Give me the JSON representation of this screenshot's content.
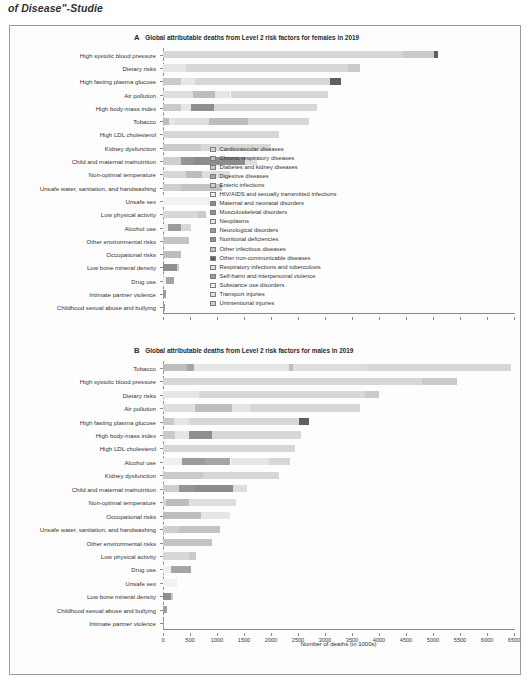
{
  "caption_fragment": "of Disease\"-Studie",
  "axis_title": "Number of deaths (in 1000s)",
  "xaxis": {
    "ticks": [
      0,
      500,
      1000,
      1500,
      2000,
      2500,
      3000,
      3500,
      4000,
      4500,
      5000,
      5500,
      6000,
      6500
    ],
    "tick_labels": [
      "0",
      "500",
      "1000",
      "1500",
      "2000",
      "2500",
      "3000",
      "3500",
      "4000",
      "4500",
      "5000",
      "5500",
      "6000",
      "6500"
    ],
    "min": 0,
    "max": 6500
  },
  "legend": {
    "position": "inside-right",
    "items": [
      {
        "label": "Cardiovascular diseases",
        "color": "#d7d7d7"
      },
      {
        "label": "Chronic respiratory diseases",
        "color": "#bdbdbd"
      },
      {
        "label": "Diabetes and kidney diseases",
        "color": "#cacaca"
      },
      {
        "label": "Digestive diseases",
        "color": "#a5a5a5"
      },
      {
        "label": "Enteric infections",
        "color": "#cfcfcf"
      },
      {
        "label": "HIV/AIDS and sexually transmitted infections",
        "color": "#f2f2f2"
      },
      {
        "label": "Maternal and neonatal disorders",
        "color": "#8c8c8c"
      },
      {
        "label": "Musculoskeletal disorders",
        "color": "#8f8f8f"
      },
      {
        "label": "Neoplasms",
        "color": "#e6e6e6"
      },
      {
        "label": "Neurological disorders",
        "color": "#9b9b9b"
      },
      {
        "label": "Nutritional deficiencies",
        "color": "#949494"
      },
      {
        "label": "Other infectious diseases",
        "color": "#c4c4c4"
      },
      {
        "label": "Other non-communicable diseases",
        "color": "#5f5f5f"
      },
      {
        "label": "Respiratory infections and tuberculosis",
        "color": "#dedede"
      },
      {
        "label": "Self-harm and interpersonal violence",
        "color": "#9e9e9e"
      },
      {
        "label": "Substance use disorders",
        "color": "#efefef"
      },
      {
        "label": "Transport injuries",
        "color": "#e2e2e2"
      },
      {
        "label": "Unintentional injuries",
        "color": "#cdcdcd"
      }
    ]
  },
  "chart_data": [
    {
      "type": "bar",
      "orientation": "horizontal",
      "panel": "A",
      "panel_letter": "A",
      "title": "Global attributable deaths from Level 2 risk factors for females in 2019",
      "xlabel": "Number of deaths (in 1000s)",
      "ylabel": "",
      "xlim": [
        0,
        6500
      ],
      "grid": false,
      "stacked": true,
      "categories": [
        "High systolic blood pressure",
        "Dietary risks",
        "High fasting plasma glucose",
        "Air pollution",
        "High body-mass index",
        "Tobacco",
        "High LDL cholesterol",
        "Kidney dysfunction",
        "Child and maternal malnutrition",
        "Non-optimal temperature",
        "Unsafe water, sanitation, and handwashing",
        "Unsafe sex",
        "Low physical activity",
        "Alcohol use",
        "Other environmental risks",
        "Occupational risks",
        "Low bone mineral density",
        "Drug use",
        "Intimate partner violence",
        "Childhood sexual abuse and bullying"
      ],
      "totals": [
        5100,
        3650,
        3300,
        3050,
        2850,
        2700,
        2150,
        2000,
        1750,
        1250,
        1100,
        850,
        800,
        520,
        480,
        330,
        290,
        200,
        55,
        45
      ],
      "stacks": [
        [
          {
            "s": "Cardiovascular diseases",
            "v": 4450
          },
          {
            "s": "Diabetes and kidney diseases",
            "v": 560
          },
          {
            "s": "Other non-communicable diseases",
            "v": 90
          }
        ],
        [
          {
            "s": "Neoplasms",
            "v": 430
          },
          {
            "s": "Cardiovascular diseases",
            "v": 3000
          },
          {
            "s": "Diabetes and kidney diseases",
            "v": 220
          }
        ],
        [
          {
            "s": "Diabetes and kidney diseases",
            "v": 330
          },
          {
            "s": "Neoplasms",
            "v": 260
          },
          {
            "s": "Cardiovascular diseases",
            "v": 2500
          },
          {
            "s": "Other non-communicable diseases",
            "v": 210
          }
        ],
        [
          {
            "s": "Respiratory infections and tuberculosis",
            "v": 560
          },
          {
            "s": "Chronic respiratory diseases",
            "v": 410
          },
          {
            "s": "Neoplasms",
            "v": 280
          },
          {
            "s": "Cardiovascular diseases",
            "v": 1800
          }
        ],
        [
          {
            "s": "Diabetes and kidney diseases",
            "v": 330
          },
          {
            "s": "Neoplasms",
            "v": 190
          },
          {
            "s": "Musculoskeletal disorders",
            "v": 420
          },
          {
            "s": "Cardiovascular diseases",
            "v": 1910
          }
        ],
        [
          {
            "s": "Chronic respiratory diseases",
            "v": 120
          },
          {
            "s": "Neoplasms",
            "v": 110
          },
          {
            "s": "Respiratory infections and tuberculosis",
            "v": 620
          },
          {
            "s": "Chronic respiratory diseases",
            "v": 730
          },
          {
            "s": "Cardiovascular diseases",
            "v": 1120
          }
        ],
        [
          {
            "s": "Cardiovascular diseases",
            "v": 2150
          }
        ],
        [
          {
            "s": "Diabetes and kidney diseases",
            "v": 700
          },
          {
            "s": "Cardiovascular diseases",
            "v": 1300
          }
        ],
        [
          {
            "s": "Enteric infections",
            "v": 330
          },
          {
            "s": "Nutritional deficiencies",
            "v": 250
          },
          {
            "s": "Maternal and neonatal disorders",
            "v": 930
          },
          {
            "s": "Respiratory infections and tuberculosis",
            "v": 240
          }
        ],
        [
          {
            "s": "Cardiovascular diseases",
            "v": 420
          },
          {
            "s": "Chronic respiratory diseases",
            "v": 300
          },
          {
            "s": "Respiratory infections and tuberculosis",
            "v": 530
          }
        ],
        [
          {
            "s": "Enteric infections",
            "v": 330
          },
          {
            "s": "Other infectious diseases",
            "v": 770
          }
        ],
        [
          {
            "s": "HIV/AIDS and sexually transmitted infections",
            "v": 830
          },
          {
            "s": "Neoplasms",
            "v": 20
          }
        ],
        [
          {
            "s": "Cardiovascular diseases",
            "v": 640
          },
          {
            "s": "Diabetes and kidney diseases",
            "v": 160
          }
        ],
        [
          {
            "s": "Substance use disorders",
            "v": 90
          },
          {
            "s": "Neurological disorders",
            "v": 250
          },
          {
            "s": "Cardiovascular diseases",
            "v": 180
          }
        ],
        [
          {
            "s": "Other infectious diseases",
            "v": 480
          }
        ],
        [
          {
            "s": "Chronic respiratory diseases",
            "v": 330
          }
        ],
        [
          {
            "s": "Musculoskeletal disorders",
            "v": 250
          },
          {
            "s": "Unintentional injuries",
            "v": 40
          }
        ],
        [
          {
            "s": "Substance use disorders",
            "v": 60
          },
          {
            "s": "Digestive diseases",
            "v": 140
          }
        ],
        [
          {
            "s": "Self-harm and interpersonal violence",
            "v": 55
          }
        ],
        [
          {
            "s": "Self-harm and interpersonal violence",
            "v": 45
          }
        ]
      ]
    },
    {
      "type": "bar",
      "orientation": "horizontal",
      "panel": "B",
      "panel_letter": "B",
      "title": "Global attributable deaths from Level 2 risk factors for males in 2019",
      "xlabel": "Number of deaths (in 1000s)",
      "ylabel": "",
      "xlim": [
        0,
        6500
      ],
      "grid": false,
      "stacked": true,
      "categories": [
        "Tobacco",
        "High systolic blood pressure",
        "Dietary risks",
        "Air pollution",
        "High fasting plasma glucose",
        "High body-mass index",
        "High LDL cholesterol",
        "Alcohol use",
        "Kidney dysfunction",
        "Child and maternal malnutrition",
        "Non-optimal temperature",
        "Occupational risks",
        "Unsafe water, sanitation, and handwashing",
        "Other environmental risks",
        "Low physical activity",
        "Drug use",
        "Unsafe sex",
        "Low bone mineral density",
        "Childhood sexual abuse and bullying",
        "Intimate partner violence"
      ],
      "totals": [
        6450,
        5450,
        4000,
        3650,
        2700,
        2550,
        2450,
        2350,
        2150,
        1550,
        1350,
        1250,
        1050,
        900,
        620,
        520,
        260,
        190,
        70,
        25
      ],
      "stacks": [
        [
          {
            "s": "Chronic respiratory diseases",
            "v": 440
          },
          {
            "s": "Digestive diseases",
            "v": 140
          },
          {
            "s": "Neoplasms",
            "v": 1760
          },
          {
            "s": "Chronic respiratory diseases",
            "v": 70
          },
          {
            "s": "Respiratory infections and tuberculosis",
            "v": 1360
          },
          {
            "s": "Cardiovascular diseases",
            "v": 2680
          }
        ],
        [
          {
            "s": "Cardiovascular diseases",
            "v": 4800
          },
          {
            "s": "Diabetes and kidney diseases",
            "v": 650
          }
        ],
        [
          {
            "s": "Neoplasms",
            "v": 660
          },
          {
            "s": "Cardiovascular diseases",
            "v": 3080
          },
          {
            "s": "Diabetes and kidney diseases",
            "v": 260
          }
        ],
        [
          {
            "s": "Respiratory infections and tuberculosis",
            "v": 590
          },
          {
            "s": "Chronic respiratory diseases",
            "v": 690
          },
          {
            "s": "Neoplasms",
            "v": 330
          },
          {
            "s": "Cardiovascular diseases",
            "v": 2040
          }
        ],
        [
          {
            "s": "Diabetes and kidney diseases",
            "v": 200
          },
          {
            "s": "Neoplasms",
            "v": 280
          },
          {
            "s": "Cardiovascular diseases",
            "v": 2030
          },
          {
            "s": "Other non-communicable diseases",
            "v": 190
          }
        ],
        [
          {
            "s": "Diabetes and kidney diseases",
            "v": 220
          },
          {
            "s": "Neoplasms",
            "v": 260
          },
          {
            "s": "Musculoskeletal disorders",
            "v": 430
          },
          {
            "s": "Cardiovascular diseases",
            "v": 1640
          }
        ],
        [
          {
            "s": "Cardiovascular diseases",
            "v": 2450
          }
        ],
        [
          {
            "s": "Substance use disorders",
            "v": 350
          },
          {
            "s": "Neurological disorders",
            "v": 420
          },
          {
            "s": "Digestive diseases",
            "v": 480
          },
          {
            "s": "Neoplasms",
            "v": 720
          },
          {
            "s": "Cardiovascular diseases",
            "v": 380
          }
        ],
        [
          {
            "s": "Diabetes and kidney diseases",
            "v": 740
          },
          {
            "s": "Cardiovascular diseases",
            "v": 1410
          }
        ],
        [
          {
            "s": "Enteric infections",
            "v": 290
          },
          {
            "s": "Nutritional deficiencies",
            "v": 300
          },
          {
            "s": "Maternal and neonatal disorders",
            "v": 700
          },
          {
            "s": "Respiratory infections and tuberculosis",
            "v": 260
          }
        ],
        [
          {
            "s": "Cardiovascular diseases",
            "v": 60
          },
          {
            "s": "Chronic respiratory diseases",
            "v": 420
          },
          {
            "s": "Respiratory infections and tuberculosis",
            "v": 870
          }
        ],
        [
          {
            "s": "Chronic respiratory diseases",
            "v": 700
          },
          {
            "s": "Neoplasms",
            "v": 550
          }
        ],
        [
          {
            "s": "Enteric infections",
            "v": 300
          },
          {
            "s": "Other infectious diseases",
            "v": 750
          }
        ],
        [
          {
            "s": "Other infectious diseases",
            "v": 900
          }
        ],
        [
          {
            "s": "Cardiovascular diseases",
            "v": 490
          },
          {
            "s": "Diabetes and kidney diseases",
            "v": 130
          }
        ],
        [
          {
            "s": "Substance use disorders",
            "v": 150
          },
          {
            "s": "Digestive diseases",
            "v": 370
          }
        ],
        [
          {
            "s": "HIV/AIDS and sexually transmitted infections",
            "v": 260
          }
        ],
        [
          {
            "s": "Musculoskeletal disorders",
            "v": 150
          },
          {
            "s": "Unintentional injuries",
            "v": 40
          }
        ],
        [
          {
            "s": "Self-harm and interpersonal violence",
            "v": 70
          }
        ],
        [
          {
            "s": "Self-harm and interpersonal violence",
            "v": 25
          }
        ]
      ]
    }
  ]
}
